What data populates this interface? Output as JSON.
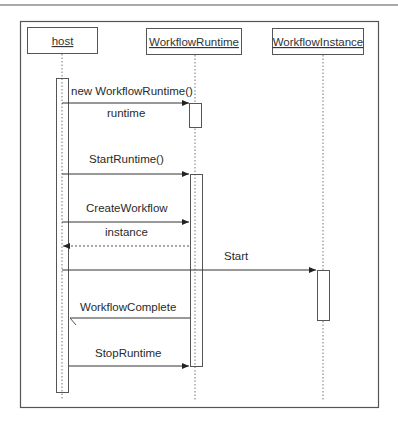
{
  "diagram": {
    "type": "sequence",
    "participants": [
      {
        "id": "host",
        "label": "host"
      },
      {
        "id": "runtime",
        "label": "WorkflowRuntime"
      },
      {
        "id": "instance",
        "label": "WorkflowInstance"
      }
    ],
    "messages": [
      {
        "label": "new WorkflowRuntime()",
        "from": "host",
        "to": "runtime",
        "style": "solid"
      },
      {
        "label": "runtime",
        "from": "runtime",
        "to": "host",
        "style": "label-only"
      },
      {
        "label": "StartRuntime()",
        "from": "host",
        "to": "runtime",
        "style": "solid"
      },
      {
        "label": "CreateWorkflow",
        "from": "host",
        "to": "runtime",
        "style": "solid"
      },
      {
        "label": "instance",
        "from": "runtime",
        "to": "host",
        "style": "dashed"
      },
      {
        "label": "Start",
        "from": "host",
        "to": "instance",
        "style": "solid"
      },
      {
        "label": "WorkflowComplete",
        "from": "runtime",
        "to": "host",
        "style": "solid"
      },
      {
        "label": "StopRuntime",
        "from": "host",
        "to": "runtime",
        "style": "solid"
      }
    ]
  }
}
